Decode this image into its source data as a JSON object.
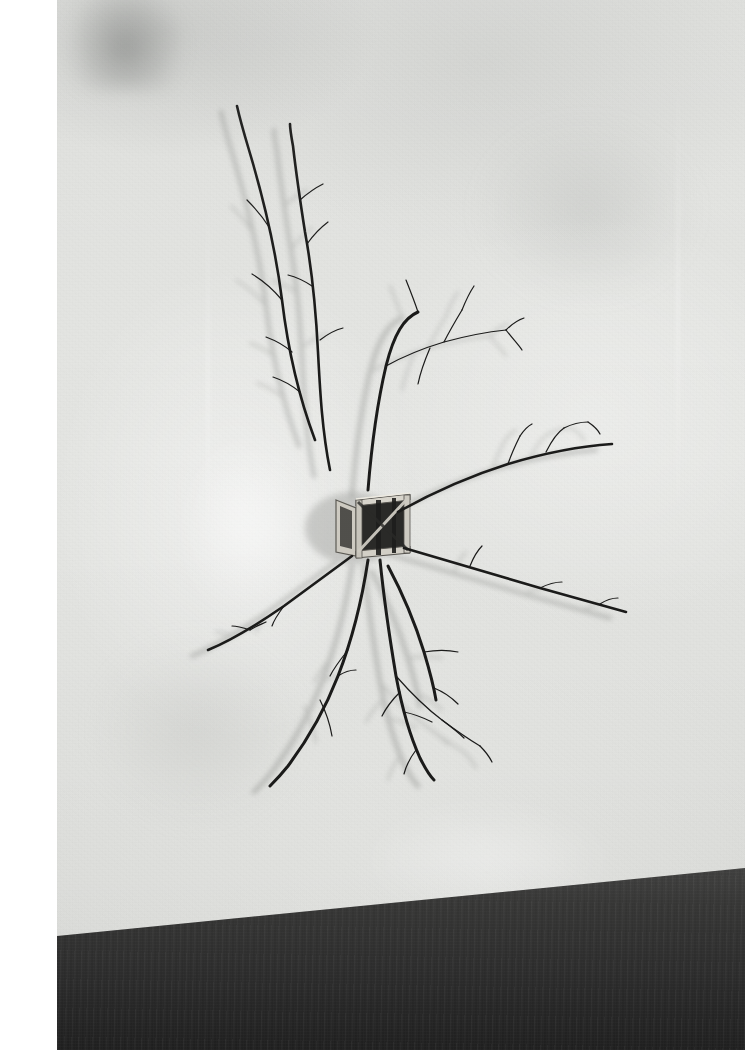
{
  "image": {
    "title": "Branch sculpture mounted on gallery wall",
    "medium": "Black-and-white photograph",
    "description": "A small open wooden crate frame is fixed to a pale plaster wall; dry tree branches radiate outward from it in a starburst, casting soft grey shadows. A dark concrete floor meets the wall along a diagonal near the bottom of the frame.",
    "orientation": "portrait",
    "dimensions": "745 x 1050"
  },
  "palette": {
    "wall_light": "#e6e7e4",
    "wall_mid": "#dcddda",
    "wall_shadow": "#c9cac7",
    "branch_dark": "#1b1b1a",
    "branch_mid": "#3a3a38",
    "branch_shadow": "#a9aaa7",
    "crate_light": "#d9d6cd",
    "crate_dark": "#222220",
    "floor_dark": "#303030",
    "floor_light": "#4a4a49",
    "print_margin": "#ffffff"
  },
  "scene": {
    "wall_label": "plaster gallery wall",
    "floor_label": "dark concrete floor",
    "crate_label": "open wooden crate frame",
    "branch_label": "radiating dry branches",
    "shadow_label": "cast branch shadows",
    "margin_label": "white print border"
  },
  "geometry": {
    "print_left": 57,
    "print_width": 688,
    "crate": {
      "x": 336,
      "y": 492,
      "w": 74,
      "h": 63
    },
    "hub": {
      "x": 372,
      "y": 496
    },
    "floor_edge_left_y": 985,
    "floor_edge_right_y": 918
  },
  "branches": {
    "upper_left": [
      "M 315 440 C 300 400 288 350 282 300 C 276 252 264 200 249 150 C 243 130 239 115 237 106",
      "M 282 300 C 272 288 262 280 252 274",
      "M 292 352 C 283 344 274 340 266 337",
      "M 300 392 C 290 384 282 380 273 377",
      "M 269 227 C 262 216 255 208 247 200"
    ],
    "upper_mid": [
      "M 330 470 C 322 430 320 390 318 352 C 316 312 312 270 305 232 C 300 200 296 172 293 146 C 291 135 290 128 290 124",
      "M 307 244 C 314 234 320 228 328 222",
      "M 300 200 C 309 192 315 188 323 184",
      "M 312 286 C 303 280 296 277 288 275",
      "M 320 340 C 329 333 335 330 343 328"
    ],
    "fan_upper_right": [
      "M 368 490 C 372 440 378 400 386 366 C 394 334 404 318 418 312",
      "M 386 366 C 404 356 424 348 444 342 C 466 336 486 332 506 330",
      "M 444 342 C 450 330 456 320 462 310",
      "M 462 310 C 466 300 470 292 474 286",
      "M 506 330 C 512 324 518 320 524 318",
      "M 506 330 C 512 338 518 344 522 350",
      "M 418 312 C 414 300 410 290 406 280",
      "M 430 348 C 424 362 420 374 418 384"
    ],
    "right_long": [
      "M 398 512 C 430 494 470 476 508 464 C 548 452 582 446 612 444",
      "M 508 464 C 512 452 516 444 520 436",
      "M 546 452 C 552 440 558 432 564 428",
      "M 564 428 C 572 424 580 422 588 422",
      "M 588 422 C 594 426 598 430 600 434",
      "M 520 436 C 524 430 528 426 532 424"
    ],
    "right_lower": [
      "M 404 548 C 444 560 492 574 540 588 C 576 598 604 606 626 612",
      "M 470 566 C 474 556 478 550 482 546",
      "M 540 588 C 548 584 556 582 562 582",
      "M 600 604 C 606 600 612 598 618 598"
    ],
    "left_lower": [
      "M 352 556 C 330 572 306 590 284 606 C 258 624 232 640 208 650",
      "M 284 606 C 278 614 274 620 272 626",
      "M 250 630 C 244 628 238 626 232 626",
      "M 250 630 C 256 626 262 624 266 622"
    ],
    "lower_center_left": [
      "M 368 560 C 362 600 352 640 338 676 C 324 712 306 742 288 766 C 280 776 274 782 270 786",
      "M 348 650 C 340 660 334 668 330 676",
      "M 320 700 C 326 712 330 724 332 736",
      "M 338 676 C 344 672 350 670 356 670"
    ],
    "lower_center_right": [
      "M 380 560 C 384 600 390 640 396 676 C 402 708 410 736 420 758 C 426 770 430 776 434 780",
      "M 396 676 C 410 692 426 708 442 720 C 458 732 470 740 480 746",
      "M 442 720 C 450 726 458 732 464 738",
      "M 400 692 C 392 700 386 708 382 716",
      "M 404 712 C 414 714 424 718 432 722",
      "M 480 746 C 486 752 490 758 492 762",
      "M 416 750 C 410 758 406 766 404 774"
    ],
    "lower_right_twig": [
      "M 388 566 C 404 596 416 626 424 652 C 430 672 434 688 436 700",
      "M 424 652 C 436 650 448 650 458 652",
      "M 434 688 C 444 692 452 698 458 704"
    ]
  },
  "crate_parts": {
    "outer_frame": "front-face outer rails",
    "side_panel": "left side panel in perspective",
    "diagonal_brace": "diagonal cross brace",
    "interior_shadow": "dark interior void"
  }
}
